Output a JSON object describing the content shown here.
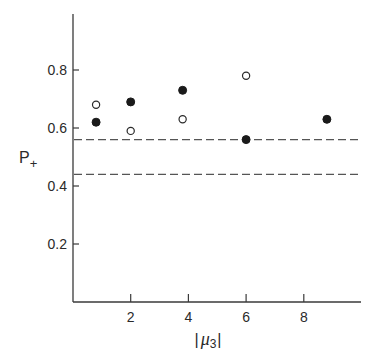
{
  "chart_data": {
    "type": "scatter",
    "title": "",
    "xlabel": "|μ3|",
    "ylabel": "P+",
    "xlim": [
      0,
      10
    ],
    "ylim": [
      0,
      1.0
    ],
    "x_ticks": [
      2,
      4,
      6,
      8
    ],
    "x_tick_labels": [
      "2",
      "4",
      "6",
      "8"
    ],
    "y_ticks": [
      0.2,
      0.4,
      0.6,
      0.8
    ],
    "y_tick_labels": [
      "0.2",
      "0.4",
      "0.6",
      "0.8"
    ],
    "grid": false,
    "legend": null,
    "series": [
      {
        "name": "filled",
        "marker": "filled-circle",
        "points": [
          {
            "x": 0.8,
            "y": 0.62
          },
          {
            "x": 2.0,
            "y": 0.69
          },
          {
            "x": 3.8,
            "y": 0.73
          },
          {
            "x": 6.0,
            "y": 0.56
          },
          {
            "x": 8.8,
            "y": 0.63
          }
        ]
      },
      {
        "name": "open",
        "marker": "open-circle",
        "points": [
          {
            "x": 0.8,
            "y": 0.68
          },
          {
            "x": 2.0,
            "y": 0.59
          },
          {
            "x": 3.8,
            "y": 0.63
          },
          {
            "x": 6.0,
            "y": 0.78
          }
        ]
      }
    ],
    "reference_lines": [
      {
        "orientation": "horizontal",
        "y": 0.56,
        "style": "dashed"
      },
      {
        "orientation": "horizontal",
        "y": 0.44,
        "style": "dashed"
      }
    ]
  },
  "labels": {
    "y_axis_main": "P",
    "y_axis_sub": "+",
    "x_axis_left_bar": "|",
    "x_axis_symbol": "μ",
    "x_axis_sub": "3",
    "x_axis_right_bar": "|"
  }
}
